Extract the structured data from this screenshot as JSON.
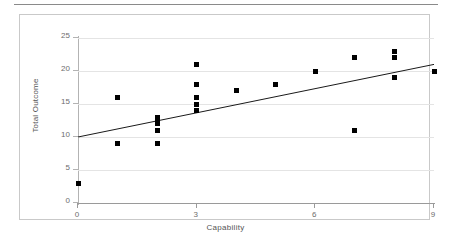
{
  "figure": {
    "has_top_rule": true,
    "border_color": "#c9c9c9",
    "marker_color": "#000000",
    "gridline_color": "#e4e4e4",
    "trendline_color": "#1a1a1a"
  },
  "chart_data": {
    "type": "scatter",
    "title": "",
    "xlabel": "Capability",
    "ylabel": "Total Outcome",
    "xlim": [
      0,
      9
    ],
    "ylim": [
      0,
      25
    ],
    "xticks": [
      0,
      3,
      6,
      9
    ],
    "xtick_labels": [
      "0",
      "3",
      "6",
      "9"
    ],
    "yticks": [
      0,
      5,
      10,
      15,
      20,
      25
    ],
    "ytick_labels": [
      "0",
      "5",
      "10",
      "15",
      "20",
      "25"
    ],
    "grid": "horizontal",
    "legend": "none",
    "points": [
      {
        "x": 0,
        "y": 3
      },
      {
        "x": 1,
        "y": 16
      },
      {
        "x": 1,
        "y": 9
      },
      {
        "x": 2,
        "y": 13
      },
      {
        "x": 2,
        "y": 12.5
      },
      {
        "x": 2,
        "y": 12
      },
      {
        "x": 2,
        "y": 11
      },
      {
        "x": 2,
        "y": 9
      },
      {
        "x": 3,
        "y": 21
      },
      {
        "x": 3,
        "y": 18
      },
      {
        "x": 3,
        "y": 16
      },
      {
        "x": 3,
        "y": 15
      },
      {
        "x": 3,
        "y": 14
      },
      {
        "x": 4,
        "y": 17
      },
      {
        "x": 5,
        "y": 18
      },
      {
        "x": 6,
        "y": 20
      },
      {
        "x": 7,
        "y": 22
      },
      {
        "x": 7,
        "y": 11
      },
      {
        "x": 8,
        "y": 23
      },
      {
        "x": 8,
        "y": 22
      },
      {
        "x": 8,
        "y": 19
      },
      {
        "x": 9,
        "y": 20
      }
    ],
    "trendline": {
      "type": "linear",
      "x_start": 0,
      "y_start": 10,
      "x_end": 9,
      "y_end": 21
    }
  }
}
